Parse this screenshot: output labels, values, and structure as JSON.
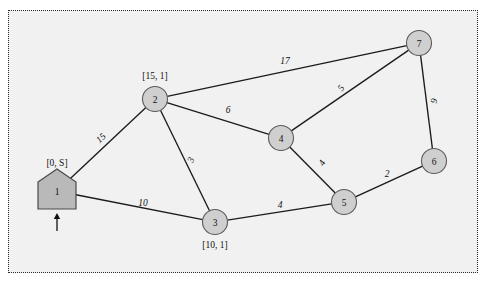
{
  "figure": {
    "title": "",
    "background_color": "#f1f1f1",
    "frame_style": "dotted",
    "frame_color": "#2a2a2a",
    "node_fill": "#cfcfcf",
    "node_stroke": "#5b5b5b",
    "edge_color": "#1b1b1b"
  },
  "chart_data": {
    "type": "diagram",
    "diagram_kind": "weighted-undirected-graph",
    "title": "",
    "xlabel": "",
    "ylabel": "",
    "grid": false,
    "legend": "none",
    "nodes": [
      {
        "id": "1",
        "label": "1",
        "shape": "house-pentagon",
        "x": 57,
        "y": 191,
        "annotation": "[0, S]",
        "annotation_x": 57,
        "annotation_y": 163,
        "is_source": true
      },
      {
        "id": "2",
        "label": "2",
        "shape": "circle",
        "x": 155,
        "y": 99,
        "annotation": "[15, 1]",
        "annotation_x": 155,
        "annotation_y": 76,
        "is_source": false
      },
      {
        "id": "3",
        "label": "3",
        "shape": "circle",
        "x": 215,
        "y": 222,
        "annotation": "[10, 1]",
        "annotation_x": 215,
        "annotation_y": 245,
        "is_source": false
      },
      {
        "id": "4",
        "label": "4",
        "shape": "circle",
        "x": 281,
        "y": 138,
        "annotation": "",
        "annotation_x": 0,
        "annotation_y": 0,
        "is_source": false
      },
      {
        "id": "5",
        "label": "5",
        "shape": "circle",
        "x": 344,
        "y": 202,
        "annotation": "",
        "annotation_x": 0,
        "annotation_y": 0,
        "is_source": false
      },
      {
        "id": "6",
        "label": "6",
        "shape": "circle",
        "x": 434,
        "y": 161,
        "annotation": "",
        "annotation_x": 0,
        "annotation_y": 0,
        "is_source": false
      },
      {
        "id": "7",
        "label": "7",
        "shape": "circle",
        "x": 419,
        "y": 43,
        "annotation": "",
        "annotation_x": 0,
        "annotation_y": 0,
        "is_source": false
      }
    ],
    "edges": [
      {
        "from": "1",
        "to": "2",
        "weight": "15",
        "label_x": 101,
        "label_y": 138,
        "label_rotate": -43
      },
      {
        "from": "1",
        "to": "3",
        "weight": "10",
        "label_x": 143,
        "label_y": 203,
        "label_rotate": 0
      },
      {
        "from": "2",
        "to": "7",
        "weight": "17",
        "label_x": 285,
        "label_y": 61,
        "label_rotate": 0
      },
      {
        "from": "2",
        "to": "4",
        "weight": "6",
        "label_x": 228,
        "label_y": 110,
        "label_rotate": 0
      },
      {
        "from": "2",
        "to": "3",
        "weight": "3",
        "label_x": 191,
        "label_y": 160,
        "label_rotate": -67
      },
      {
        "from": "3",
        "to": "5",
        "weight": "4",
        "label_x": 280,
        "label_y": 205,
        "label_rotate": 0
      },
      {
        "from": "4",
        "to": "7",
        "weight": "5",
        "label_x": 341,
        "label_y": 88,
        "label_rotate": -53
      },
      {
        "from": "4",
        "to": "5",
        "weight": "4",
        "label_x": 322,
        "label_y": 163,
        "label_rotate": -60
      },
      {
        "from": "5",
        "to": "6",
        "weight": "2",
        "label_x": 387,
        "label_y": 174,
        "label_rotate": 0
      },
      {
        "from": "7",
        "to": "6",
        "weight": "9",
        "label_x": 434,
        "label_y": 101,
        "label_rotate": -80
      }
    ],
    "annotations": [
      {
        "name": "source-node-label",
        "text": "[0, S]"
      },
      {
        "name": "node-2-label",
        "text": "[15, 1]"
      },
      {
        "name": "node-3-label",
        "text": "[10, 1]"
      }
    ],
    "source_arrow": {
      "x": 57,
      "y_top": 213,
      "y_bottom": 231
    }
  }
}
